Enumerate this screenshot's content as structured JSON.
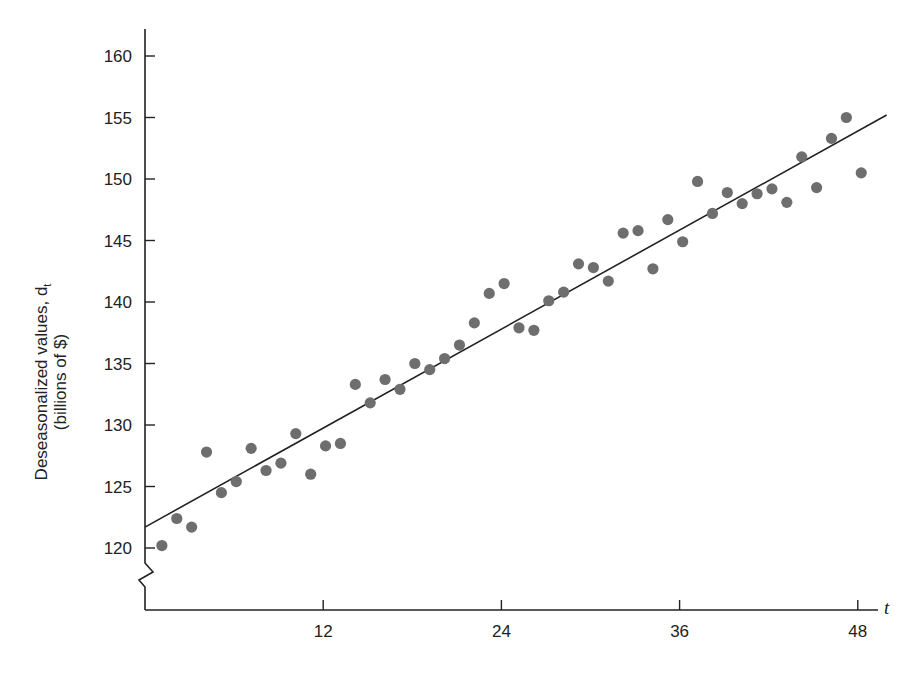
{
  "chart_data": {
    "type": "scatter",
    "title": "",
    "xlabel": "t",
    "ylabel": "Deseasonalized values, d_t",
    "ylabel_line1": "Deseasonalized values, d",
    "ylabel_subscript": "t",
    "ylabel_line2": "(billions of $)",
    "xlim": [
      0,
      49
    ],
    "ylim": [
      116,
      162
    ],
    "x_ticks": [
      12,
      24,
      36,
      48
    ],
    "x_tick_labels": [
      "12",
      "24",
      "36",
      "48"
    ],
    "y_ticks": [
      120,
      125,
      130,
      135,
      140,
      145,
      150,
      155,
      160
    ],
    "y_tick_labels": [
      "120",
      "125",
      "130",
      "135",
      "140",
      "145",
      "150",
      "155",
      "160"
    ],
    "y_axis_break": true,
    "grid": false,
    "legend": null,
    "series": [
      {
        "name": "Deseasonalized values",
        "kind": "scatter",
        "color": "#6e6e6e",
        "x": [
          1,
          2,
          3,
          4,
          5,
          6,
          7,
          8,
          9,
          10,
          11,
          12,
          13,
          14,
          15,
          16,
          17,
          18,
          19,
          20,
          21,
          22,
          23,
          24,
          25,
          26,
          27,
          28,
          29,
          30,
          31,
          32,
          33,
          34,
          35,
          36,
          37,
          38,
          39,
          40,
          41,
          42,
          43,
          44,
          45,
          46,
          47,
          48
        ],
        "values": [
          120.2,
          122.4,
          121.7,
          127.8,
          124.5,
          125.4,
          128.1,
          126.3,
          126.9,
          129.3,
          126.0,
          128.3,
          128.5,
          133.3,
          131.8,
          133.7,
          132.9,
          135.0,
          134.5,
          135.4,
          136.5,
          138.3,
          140.7,
          141.5,
          137.9,
          137.7,
          140.1,
          140.8,
          143.1,
          142.8,
          141.7,
          145.6,
          145.8,
          142.7,
          146.7,
          144.9,
          149.8,
          147.2,
          148.9,
          148.0,
          148.8,
          149.2,
          148.1,
          151.8,
          149.3,
          153.3,
          155.0,
          150.5
        ]
      },
      {
        "name": "Linear trend",
        "kind": "line",
        "color": "#222222",
        "x": [
          0,
          49
        ],
        "values": [
          121.7,
          155.2
        ]
      }
    ]
  }
}
